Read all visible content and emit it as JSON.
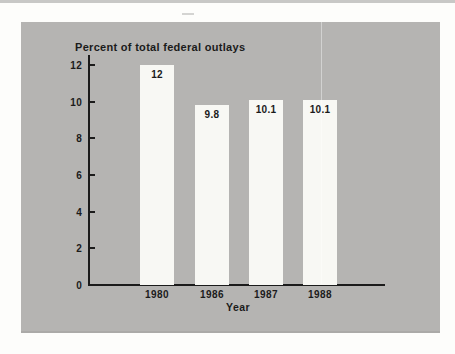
{
  "page": {
    "background_color": "#fdfdfb",
    "top_edge_color": "#c8c8c6",
    "panel_color": "#b5b4b2",
    "bar_color": "#f8f8f4",
    "ink_color": "#1b1b1b"
  },
  "chart": {
    "title": "Percent of total federal outlays",
    "x_axis_title": "Year",
    "y_ticks": [
      "12",
      "10",
      "8",
      "6",
      "4",
      "2",
      "0"
    ],
    "bars": [
      {
        "category": "1980",
        "value_label": "12"
      },
      {
        "category": "1986",
        "value_label": "9.8"
      },
      {
        "category": "1987",
        "value_label": "10.1"
      },
      {
        "category": "1988",
        "value_label": "10.1"
      }
    ]
  },
  "chart_data": {
    "type": "bar",
    "title": "Percent of total federal outlays",
    "categories": [
      "1980",
      "1986",
      "1987",
      "1988"
    ],
    "values": [
      12,
      9.8,
      10.1,
      10.1
    ],
    "data_labels": [
      "12",
      "9.8",
      "10.1",
      "10.1"
    ],
    "xlabel": "Year",
    "ylabel": "Percent of total federal outlays",
    "ylim": [
      0,
      12
    ],
    "ytick_step": 2,
    "grid": false,
    "legend": false,
    "bar_color": "#f8f8f4",
    "background_color": "#b5b4b2"
  }
}
